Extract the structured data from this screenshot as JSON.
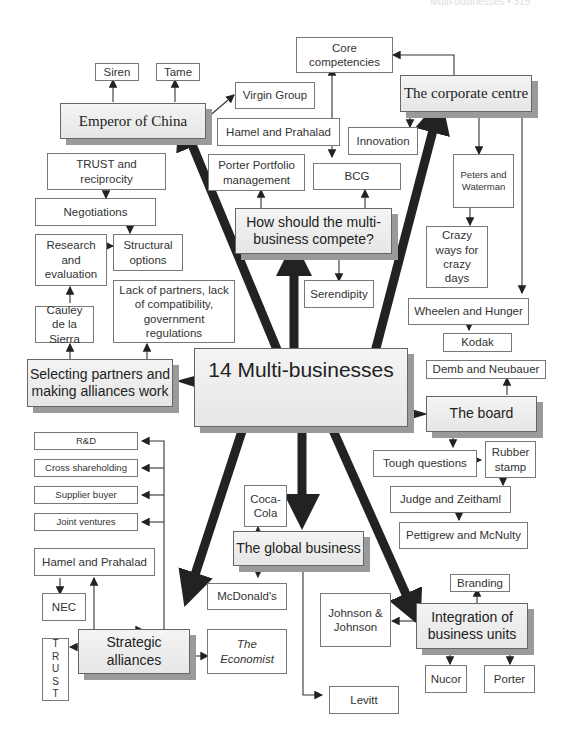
{
  "page_header": "Multi-businesses • 315",
  "center": "14 Multi-businesses",
  "hubs": {
    "emperor": "Emperor of China",
    "corporate": "The corporate centre",
    "compete": "How should the multi-business compete?",
    "selecting": "Selecting partners and making alliances work",
    "board": "The board",
    "global": "The global business",
    "strategic": "Strategic alliances",
    "integration": "Integration of business units"
  },
  "nodes": {
    "siren": "Siren",
    "tame": "Tame",
    "virgin": "Virgin Group",
    "core": "Core competencies",
    "hamel_top": "Hamel and Prahalad",
    "innovation": "Innovation",
    "porter_portfolio": "Porter Portfolio management",
    "bcg": "BCG",
    "peters": "Peters and Waterman",
    "crazy": "Crazy ways for crazy days",
    "serendipity": "Serendipity",
    "wheelen": "Wheelen and Hunger",
    "kodak": "Kodak",
    "demb": "Demb and Neubauer",
    "trust_rec": "TRUST and reciprocity",
    "negotiations": "Negotiations",
    "research": "Research and evaluation",
    "structural": "Structural options",
    "cauley": "Cauley de la Sierra",
    "lack": "Lack of partners, lack of compatibility, government regulations",
    "tough": "Tough questions",
    "rubber": "Rubber stamp",
    "judge": "Judge and Zeithaml",
    "pettigrew": "Pettigrew and McNulty",
    "rd": "R&D",
    "cross": "Cross shareholding",
    "supplier": "Supplier buyer",
    "joint": "Joint ventures",
    "hamel_bottom": "Hamel and Prahalad",
    "nec": "NEC",
    "coca": "Coca-Cola",
    "mcdonalds": "McDonald's",
    "branding": "Branding",
    "jj": "Johnson & Johnson",
    "levitt": "Levitt",
    "nucor": "Nucor",
    "porter": "Porter",
    "economist": "The Economist",
    "trust_vertical": [
      "T",
      "R",
      "U",
      "S",
      "T"
    ]
  }
}
